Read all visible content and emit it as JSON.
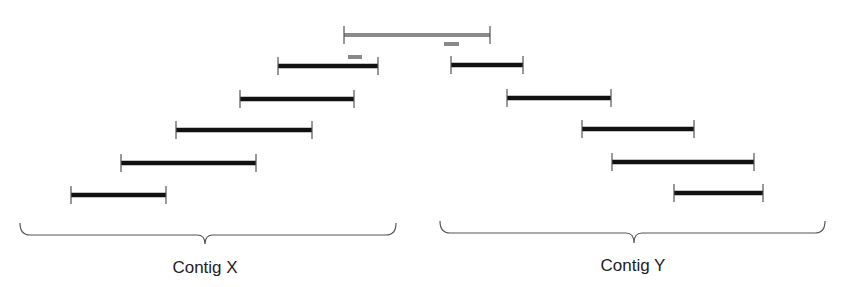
{
  "diagram": {
    "colors": {
      "background": "#ffffff",
      "read": "#111111",
      "endcap": "#555555",
      "reference": "#8a8a8a",
      "brace": "#555555",
      "label": "#222222"
    },
    "reference_bar": {
      "x1": 344,
      "x2": 490,
      "y": 35
    },
    "markers": [
      {
        "x1": 348,
        "x2": 362,
        "y": 57
      },
      {
        "x1": 444,
        "x2": 459,
        "y": 44
      }
    ],
    "groups": [
      {
        "label": "Contig X",
        "label_x": 205,
        "label_y": 258,
        "brace": {
          "x1": 20,
          "x2": 396,
          "top": 223,
          "line": 235,
          "tip_x": 205,
          "tip_y": 244
        },
        "reads": [
          {
            "x1": 278,
            "x2": 378,
            "y": 66
          },
          {
            "x1": 240,
            "x2": 354,
            "y": 99
          },
          {
            "x1": 176,
            "x2": 312,
            "y": 130
          },
          {
            "x1": 121,
            "x2": 256,
            "y": 163
          },
          {
            "x1": 71,
            "x2": 166,
            "y": 195
          }
        ]
      },
      {
        "label": "Contig Y",
        "label_x": 633,
        "label_y": 256,
        "brace": {
          "x1": 440,
          "x2": 825,
          "top": 221,
          "line": 233,
          "tip_x": 634,
          "tip_y": 243
        },
        "reads": [
          {
            "x1": 451,
            "x2": 523,
            "y": 65
          },
          {
            "x1": 507,
            "x2": 611,
            "y": 98
          },
          {
            "x1": 582,
            "x2": 694,
            "y": 129
          },
          {
            "x1": 612,
            "x2": 754,
            "y": 162
          },
          {
            "x1": 674,
            "x2": 763,
            "y": 193
          }
        ]
      }
    ]
  }
}
